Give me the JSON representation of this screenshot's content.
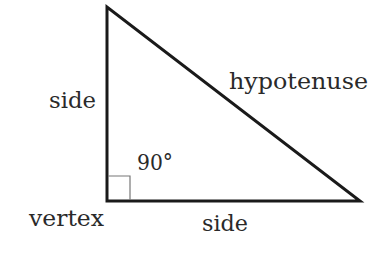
{
  "diagram": {
    "type": "right-triangle",
    "labels": {
      "left_side": "side",
      "hypotenuse": "hypotenuse",
      "angle": "90°",
      "vertex": "vertex",
      "bottom_side": "side"
    },
    "colors": {
      "stroke": "#1a1a1a",
      "right_angle_marker": "#777777",
      "text": "#2a2a2a",
      "background": "#ffffff"
    }
  }
}
